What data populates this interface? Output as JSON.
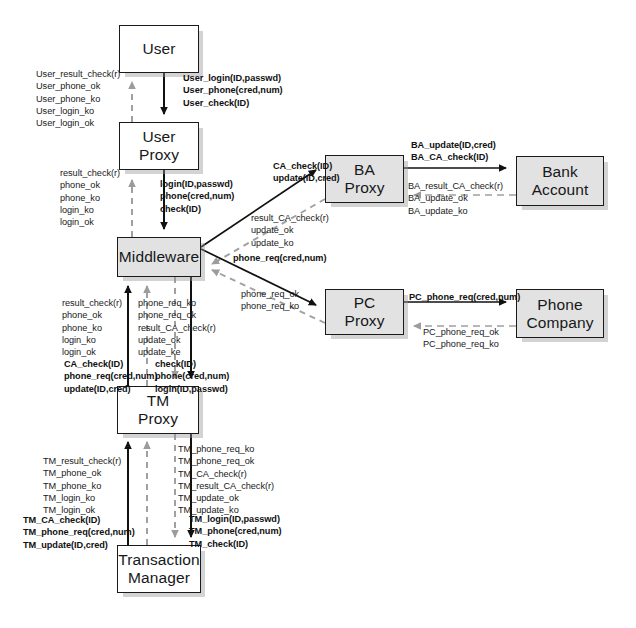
{
  "diagram": {
    "type": "component-interaction-diagram",
    "colors": {
      "stroke": "#1a1a1a",
      "dashed_stroke": "#9a9a9a",
      "shaded_fill": "#e2e2e2",
      "plain_fill": "#ffffff",
      "text": "#202020",
      "shadow": "#969696"
    },
    "nodes": [
      {
        "id": "user",
        "label_lines": [
          "User"
        ],
        "x": 119,
        "y": 25,
        "w": 80,
        "h": 48,
        "shaded": false
      },
      {
        "id": "user_proxy",
        "label_lines": [
          "User",
          "Proxy"
        ],
        "x": 119,
        "y": 122,
        "w": 80,
        "h": 48,
        "shaded": false
      },
      {
        "id": "middleware",
        "label_lines": [
          "Middleware"
        ],
        "x": 117,
        "y": 237,
        "w": 84,
        "h": 40,
        "shaded": true
      },
      {
        "id": "ba_proxy",
        "label_lines": [
          "BA",
          "Proxy"
        ],
        "x": 325,
        "y": 155,
        "w": 79,
        "h": 48,
        "shaded": true
      },
      {
        "id": "bank",
        "label_lines": [
          "Bank",
          "Account"
        ],
        "x": 516,
        "y": 156,
        "w": 88,
        "h": 50,
        "shaded": true
      },
      {
        "id": "pc_proxy",
        "label_lines": [
          "PC",
          "Proxy"
        ],
        "x": 325,
        "y": 289,
        "w": 79,
        "h": 46,
        "shaded": true
      },
      {
        "id": "phone_co",
        "label_lines": [
          "Phone",
          "Company"
        ],
        "x": 516,
        "y": 289,
        "w": 88,
        "h": 49,
        "shaded": true
      },
      {
        "id": "tm_proxy",
        "label_lines": [
          "TM",
          "Proxy"
        ],
        "x": 117,
        "y": 386,
        "w": 82,
        "h": 48,
        "shaded": false
      },
      {
        "id": "tx_mgr",
        "label_lines": [
          "Transaction",
          "Manager"
        ],
        "x": 117,
        "y": 545,
        "w": 84,
        "h": 48,
        "shaded": false
      }
    ],
    "labels": [
      {
        "id": "user-up",
        "x": 36,
        "y": 68,
        "bold": false,
        "align": "left",
        "lines": [
          "User_result_check(r)",
          "User_phone_ok",
          "User_phone_ko",
          "User_login_ko",
          "User_login_ok"
        ]
      },
      {
        "id": "user-down",
        "x": 183,
        "y": 72,
        "bold": true,
        "align": "left",
        "lines": [
          "User_login(ID,passwd)",
          "User_phone(cred,num)",
          "User_check(ID)"
        ]
      },
      {
        "id": "proxy-up",
        "x": 60,
        "y": 167,
        "bold": false,
        "align": "left",
        "lines": [
          "result_check(r)",
          "phone_ok",
          "phone_ko",
          "login_ko",
          "login_ok"
        ]
      },
      {
        "id": "proxy-down",
        "x": 160,
        "y": 178,
        "bold": true,
        "align": "left",
        "lines": [
          "login(ID,passwd)",
          "phone(cred,num)",
          "check(ID)"
        ]
      },
      {
        "id": "ca-check",
        "x": 273,
        "y": 160,
        "bold": true,
        "align": "left",
        "lines": [
          "CA_check(ID)",
          "update(ID,cred)"
        ]
      },
      {
        "id": "ca-result",
        "x": 251,
        "y": 212,
        "bold": false,
        "align": "left",
        "lines": [
          "result_CA_check(r)",
          "update_ok",
          "update_ko"
        ]
      },
      {
        "id": "phone-req",
        "x": 233,
        "y": 252,
        "bold": true,
        "align": "left",
        "lines": [
          "phone_req(cred,num)"
        ]
      },
      {
        "id": "phone-req-res",
        "x": 241,
        "y": 288,
        "bold": false,
        "align": "left",
        "lines": [
          "phone_req_ok",
          "phone_req_ko"
        ]
      },
      {
        "id": "ba-down",
        "x": 411,
        "y": 139,
        "bold": true,
        "align": "left",
        "lines": [
          "BA_update(ID,cred)",
          "BA_CA_check(ID)"
        ]
      },
      {
        "id": "ba-up",
        "x": 408,
        "y": 180,
        "bold": false,
        "align": "left",
        "lines": [
          "BA_result_CA_check(r)",
          "  BA_update_ok",
          "  BA_update_ko"
        ]
      },
      {
        "id": "pc-down",
        "x": 409,
        "y": 291,
        "bold": true,
        "align": "left",
        "lines": [
          "PC_phone_req(cred,num)"
        ]
      },
      {
        "id": "pc-up",
        "x": 423,
        "y": 326,
        "bold": false,
        "align": "left",
        "lines": [
          "PC_phone_req_ok",
          "PC_phone_req_ko"
        ]
      },
      {
        "id": "mw-tm-up",
        "x": 62,
        "y": 297,
        "bold": false,
        "align": "left",
        "lines": [
          "result_check(r)",
          "phone_ok",
          "phone_ko",
          "login_ko",
          "login_ok"
        ]
      },
      {
        "id": "mw-tm-up2",
        "x": 64,
        "y": 358,
        "bold": true,
        "align": "left",
        "lines": [
          "CA_check(ID)",
          "phone_req(cred,num)",
          "update(ID,cred)"
        ]
      },
      {
        "id": "mw-tm-mid",
        "x": 138,
        "y": 297,
        "bold": false,
        "align": "left",
        "lines": [
          "phone_req_ko",
          "phone_req_ok",
          "result_CA_check(r)",
          "update_ok",
          "update_ke"
        ]
      },
      {
        "id": "mw-tm-down",
        "x": 155,
        "y": 358,
        "bold": true,
        "align": "left",
        "lines": [
          "check(ID)",
          "phone(cred,num)",
          "login(ID,passwd)"
        ]
      },
      {
        "id": "tm-up",
        "x": 43,
        "y": 455,
        "bold": false,
        "align": "left",
        "lines": [
          "TM_result_check(r)",
          "TM_phone_ok",
          "TM_phone_ko",
          "TM_login_ko",
          "TM_login_ok"
        ]
      },
      {
        "id": "tm-up2",
        "x": 23,
        "y": 514,
        "bold": true,
        "align": "left",
        "lines": [
          "TM_CA_check(ID)",
          "TM_phone_req(cred,num)",
          "TM_update(ID,cred)"
        ]
      },
      {
        "id": "tm-mid",
        "x": 178,
        "y": 443,
        "bold": false,
        "align": "left",
        "lines": [
          "TM_phone_req_ko",
          "TM_phone_req_ok",
          "TM_CA_check(r)",
          "TM_result_CA_check(r)",
          "TM_update_ok",
          "TM_update_ko"
        ]
      },
      {
        "id": "tm-down",
        "x": 189,
        "y": 513,
        "bold": true,
        "align": "left",
        "lines": [
          "TM_login(ID,passwd)",
          "TM_phone(cred,num)",
          "TM_check(ID)"
        ]
      }
    ],
    "edges": [
      {
        "id": "user-to-proxy",
        "from": "user",
        "to": "user_proxy",
        "style": "solid",
        "direction": "down"
      },
      {
        "id": "proxy-to-user",
        "from": "user_proxy",
        "to": "user",
        "style": "dashed",
        "direction": "up"
      },
      {
        "id": "proxy-to-middleware",
        "from": "user_proxy",
        "to": "middleware",
        "style": "solid",
        "direction": "down"
      },
      {
        "id": "middleware-to-proxy",
        "from": "middleware",
        "to": "user_proxy",
        "style": "dashed",
        "direction": "up"
      },
      {
        "id": "middleware-to-ba",
        "from": "middleware",
        "to": "ba_proxy",
        "style": "solid",
        "direction": "right"
      },
      {
        "id": "ba-to-middleware",
        "from": "ba_proxy",
        "to": "middleware",
        "style": "dashed",
        "direction": "left"
      },
      {
        "id": "middleware-to-pc",
        "from": "middleware",
        "to": "pc_proxy",
        "style": "solid",
        "direction": "right"
      },
      {
        "id": "pc-to-middleware",
        "from": "pc_proxy",
        "to": "middleware",
        "style": "dashed",
        "direction": "left"
      },
      {
        "id": "ba-to-bank",
        "from": "ba_proxy",
        "to": "bank",
        "style": "solid",
        "direction": "right"
      },
      {
        "id": "bank-to-ba",
        "from": "bank",
        "to": "ba_proxy",
        "style": "dashed",
        "direction": "left"
      },
      {
        "id": "pc-to-phoneco",
        "from": "pc_proxy",
        "to": "phone_co",
        "style": "solid",
        "direction": "right"
      },
      {
        "id": "phoneco-to-pc",
        "from": "phone_co",
        "to": "pc_proxy",
        "style": "dashed",
        "direction": "left"
      },
      {
        "id": "tm-to-middleware-a",
        "from": "tm_proxy",
        "to": "middleware",
        "style": "solid",
        "direction": "up"
      },
      {
        "id": "tm-to-middleware-b",
        "from": "tm_proxy",
        "to": "middleware",
        "style": "dashed",
        "direction": "up"
      },
      {
        "id": "middleware-to-tm-a",
        "from": "middleware",
        "to": "tm_proxy",
        "style": "dashed",
        "direction": "down"
      },
      {
        "id": "middleware-to-tm-b",
        "from": "middleware",
        "to": "tm_proxy",
        "style": "solid",
        "direction": "down"
      },
      {
        "id": "txmgr-to-tm-a",
        "from": "tx_mgr",
        "to": "tm_proxy",
        "style": "solid",
        "direction": "up"
      },
      {
        "id": "txmgr-to-tm-b",
        "from": "tx_mgr",
        "to": "tm_proxy",
        "style": "dashed",
        "direction": "up"
      },
      {
        "id": "tm-to-txmgr-a",
        "from": "tm_proxy",
        "to": "tx_mgr",
        "style": "dashed",
        "direction": "down"
      },
      {
        "id": "tm-to-txmgr-b",
        "from": "tm_proxy",
        "to": "tx_mgr",
        "style": "solid",
        "direction": "down"
      }
    ]
  }
}
